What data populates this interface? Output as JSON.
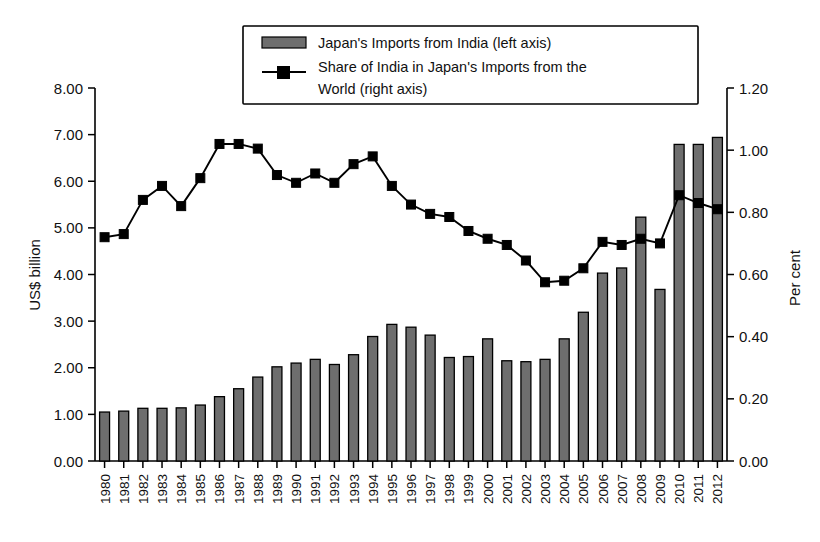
{
  "chart_data": {
    "type": "bar",
    "title": "",
    "subtitle": "",
    "xlabel": "",
    "ylabel": "US$ billion",
    "y2label": "Per cent",
    "ylim": [
      0,
      8
    ],
    "y2lim": [
      0,
      1.2
    ],
    "ytick_labels": [
      "0.00",
      "1.00",
      "2.00",
      "3.00",
      "4.00",
      "5.00",
      "6.00",
      "7.00",
      "8.00"
    ],
    "ytick_values": [
      0,
      1,
      2,
      3,
      4,
      5,
      6,
      7,
      8
    ],
    "y2tick_labels": [
      "0.00",
      "0.20",
      "0.40",
      "0.60",
      "0.80",
      "1.00",
      "1.20"
    ],
    "y2tick_values": [
      0,
      0.2,
      0.4,
      0.6,
      0.8,
      1.0,
      1.2
    ],
    "grid": false,
    "legend_position": "top-center",
    "categories": [
      "1980",
      "1981",
      "1982",
      "1983",
      "1984",
      "1985",
      "1986",
      "1987",
      "1988",
      "1989",
      "1990",
      "1991",
      "1992",
      "1993",
      "1994",
      "1995",
      "1996",
      "1997",
      "1998",
      "1999",
      "2000",
      "2001",
      "2002",
      "2003",
      "2004",
      "2005",
      "2006",
      "2007",
      "2008",
      "2009",
      "2010",
      "2011",
      "2012"
    ],
    "series": [
      {
        "name": "Japan's Imports from India (left axis)",
        "type": "bar",
        "axis": "left",
        "unit": "US$ billion",
        "color": "#6e6e6e",
        "values": [
          1.05,
          1.07,
          1.13,
          1.13,
          1.14,
          1.2,
          1.38,
          1.55,
          1.8,
          2.02,
          2.1,
          2.18,
          2.07,
          2.28,
          2.67,
          2.93,
          2.87,
          2.7,
          2.22,
          2.24,
          2.62,
          2.15,
          2.13,
          2.18,
          2.62,
          3.19,
          4.03,
          4.14,
          5.23,
          3.68,
          6.79,
          6.79,
          6.94
        ]
      },
      {
        "name": "Share of India in Japan's Imports from the World (right axis)",
        "type": "line",
        "axis": "right",
        "unit": "Per cent",
        "color": "#000000",
        "values": [
          0.72,
          0.73,
          0.84,
          0.885,
          0.82,
          0.91,
          1.02,
          1.02,
          1.005,
          0.92,
          0.895,
          0.925,
          0.895,
          0.955,
          0.98,
          0.885,
          0.825,
          0.795,
          0.785,
          0.74,
          0.715,
          0.695,
          0.645,
          0.575,
          0.58,
          0.62,
          0.705,
          0.695,
          0.715,
          0.7,
          0.855,
          0.83,
          0.81
        ]
      }
    ]
  },
  "legend": {
    "items": [
      {
        "label": "Japan's Imports from India (left axis)",
        "marker": "bar-swatch"
      },
      {
        "label": "Share of India in Japan's Imports from the",
        "label2": "World (right axis)",
        "marker": "line-square"
      }
    ]
  },
  "axes": {
    "left_title": "US$ billion",
    "right_title": "Per cent"
  }
}
